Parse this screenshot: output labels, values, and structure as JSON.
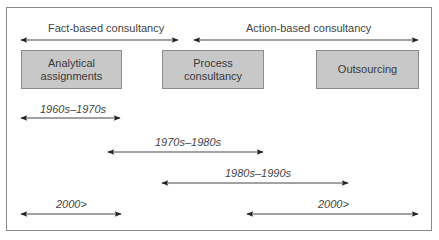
{
  "diagram": {
    "categories": [
      {
        "label": "Fact-based consultancy",
        "arrow": {
          "x1": 21,
          "x2": 178,
          "y": 40
        },
        "label_x": 48,
        "label_y": 22
      },
      {
        "label": "Action-based consultancy",
        "arrow": {
          "x1": 194,
          "x2": 418,
          "y": 40
        },
        "label_x": 246,
        "label_y": 22
      }
    ],
    "boxes": [
      {
        "label": "Analytical assignments",
        "x": 21,
        "y": 50,
        "w": 101,
        "h": 39
      },
      {
        "label": "Process consultancy",
        "x": 162,
        "y": 50,
        "w": 102,
        "h": 39
      },
      {
        "label": "Outsourcing",
        "x": 316,
        "y": 50,
        "w": 103,
        "h": 39
      }
    ],
    "periods": [
      {
        "label": "1960s–1970s",
        "arrow": {
          "x1": 21,
          "x2": 120,
          "y": 118
        },
        "label_x": 40,
        "label_y": 103
      },
      {
        "label": "1970s–1980s",
        "arrow": {
          "x1": 108,
          "x2": 263,
          "y": 152
        },
        "label_x": 155,
        "label_y": 136
      },
      {
        "label": "1980s–1990s",
        "arrow": {
          "x1": 162,
          "x2": 348,
          "y": 183
        },
        "label_x": 225,
        "label_y": 167
      },
      {
        "label": "2000>",
        "arrow": {
          "x1": 21,
          "x2": 121,
          "y": 214
        },
        "label_x": 56,
        "label_y": 198
      },
      {
        "label": "2000>",
        "arrow": {
          "x1": 247,
          "x2": 418,
          "y": 214
        },
        "label_x": 318,
        "label_y": 198
      }
    ],
    "colors": {
      "box_fill": "#c8c8c8",
      "box_border": "#8c8c8c",
      "arrow": "#222222",
      "frame": "#8a8a8a"
    }
  }
}
